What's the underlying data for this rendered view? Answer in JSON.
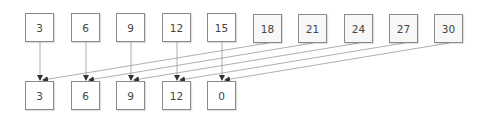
{
  "diagram": {
    "title": "",
    "colors": {
      "border": "#8a8a8a",
      "line": "#9a9a9a",
      "arrow": "#333333",
      "text": "#444444"
    },
    "top_row": [
      {
        "label": "3",
        "x": 25,
        "y": 13,
        "shaded": false
      },
      {
        "label": "6",
        "x": 71,
        "y": 13,
        "shaded": false
      },
      {
        "label": "9",
        "x": 116,
        "y": 13,
        "shaded": false
      },
      {
        "label": "12",
        "x": 162,
        "y": 13,
        "shaded": false
      },
      {
        "label": "15",
        "x": 207,
        "y": 13,
        "shaded": false
      },
      {
        "label": "18",
        "x": 253,
        "y": 14,
        "shaded": true
      },
      {
        "label": "21",
        "x": 298,
        "y": 14,
        "shaded": true
      },
      {
        "label": "24",
        "x": 344,
        "y": 14,
        "shaded": true
      },
      {
        "label": "27",
        "x": 389,
        "y": 14,
        "shaded": true
      },
      {
        "label": "30",
        "x": 434,
        "y": 14,
        "shaded": true
      }
    ],
    "bottom_row": [
      {
        "label": "3",
        "x": 25,
        "y": 81
      },
      {
        "label": "6",
        "x": 71,
        "y": 81
      },
      {
        "label": "9",
        "x": 116,
        "y": 81
      },
      {
        "label": "12",
        "x": 162,
        "y": 81
      },
      {
        "label": "0",
        "x": 207,
        "y": 81
      }
    ],
    "edges": [
      {
        "from": "top.0",
        "to": "bottom.0",
        "x1": 40,
        "y1": 42,
        "x2": 40,
        "y2": 80
      },
      {
        "from": "top.1",
        "to": "bottom.1",
        "x1": 86,
        "y1": 42,
        "x2": 86,
        "y2": 80
      },
      {
        "from": "top.2",
        "to": "bottom.2",
        "x1": 131,
        "y1": 42,
        "x2": 131,
        "y2": 80
      },
      {
        "from": "top.3",
        "to": "bottom.3",
        "x1": 177,
        "y1": 42,
        "x2": 177,
        "y2": 80
      },
      {
        "from": "top.4",
        "to": "bottom.4",
        "x1": 222,
        "y1": 42,
        "x2": 222,
        "y2": 80
      },
      {
        "from": "top.5",
        "to": "bottom.0",
        "x1": 268,
        "y1": 43,
        "x2": 43,
        "y2": 80
      },
      {
        "from": "top.6",
        "to": "bottom.1",
        "x1": 313,
        "y1": 43,
        "x2": 89,
        "y2": 80
      },
      {
        "from": "top.7",
        "to": "bottom.2",
        "x1": 359,
        "y1": 43,
        "x2": 134,
        "y2": 80
      },
      {
        "from": "top.8",
        "to": "bottom.3",
        "x1": 404,
        "y1": 43,
        "x2": 180,
        "y2": 80
      },
      {
        "from": "top.9",
        "to": "bottom.4",
        "x1": 449,
        "y1": 43,
        "x2": 225,
        "y2": 80
      }
    ]
  }
}
